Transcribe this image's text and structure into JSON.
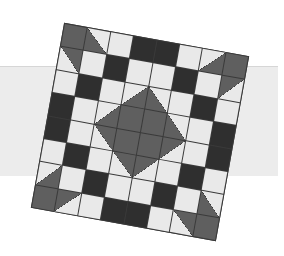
{
  "colors": {
    "light": "#e9e9e9",
    "dark": "#2f2f2f",
    "mid": "#5f5f5f",
    "band": "#ececec"
  },
  "quilt": {
    "rows": 8,
    "cols": 8,
    "rotation_deg": 10.2,
    "cells": [
      [
        "G",
        "T:ll",
        "L",
        "D",
        "D",
        "L",
        "T:lr",
        "G"
      ],
      [
        "T:ur",
        "L",
        "D",
        "L",
        "L",
        "D",
        "L",
        "T:ul"
      ],
      [
        "L",
        "D",
        "L",
        "T:lr",
        "T:ll",
        "L",
        "D",
        "L"
      ],
      [
        "D",
        "L",
        "T:lr",
        "G",
        "G",
        "T:ll",
        "L",
        "D"
      ],
      [
        "D",
        "L",
        "T:ur",
        "G",
        "G",
        "T:ul",
        "L",
        "D"
      ],
      [
        "L",
        "D",
        "L",
        "T:ur",
        "T:ul",
        "L",
        "D",
        "L"
      ],
      [
        "T:lr",
        "L",
        "D",
        "L",
        "L",
        "D",
        "L",
        "T:ll"
      ],
      [
        "G",
        "T:ul",
        "L",
        "D",
        "D",
        "L",
        "T:ur",
        "G"
      ]
    ]
  }
}
